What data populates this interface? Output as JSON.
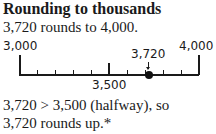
{
  "heading": "Rounding to thousands",
  "statement": "3,720 rounds to 4,000.",
  "number_line": {
    "start_label": "3,000",
    "mid_label": "3,500",
    "end_label": "4,000",
    "point_label": "3,720",
    "start": 3000,
    "end": 4000,
    "midpoint": 3500,
    "point": 3720,
    "minor_tick_step": 100
  },
  "explanation": {
    "line1": "3,720 > 3,500 (halfway), so",
    "line2": "3,720 rounds up.*"
  }
}
